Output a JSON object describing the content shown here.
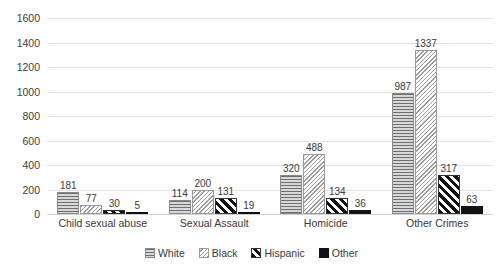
{
  "chart_data": {
    "type": "bar",
    "title": "",
    "subtitle": "",
    "xlabel": "",
    "ylabel": "",
    "ylim": [
      0,
      1600
    ],
    "yticks": [
      0,
      200,
      400,
      600,
      800,
      1000,
      1200,
      1400,
      1600
    ],
    "grid": true,
    "legend_position": "bottom",
    "categories": [
      "Child sexual abuse",
      "Sexual Assault",
      "Homicide",
      "Other Crimes"
    ],
    "series": [
      {
        "name": "White",
        "pattern": "horizontal-lines",
        "color": "#c9c9c9",
        "values": [
          181,
          114,
          320,
          987
        ]
      },
      {
        "name": "Black",
        "pattern": "light-diagonal",
        "color": "#ffffff",
        "values": [
          77,
          200,
          488,
          1337
        ]
      },
      {
        "name": "Hispanic",
        "pattern": "thick-diagonal",
        "color": "#111111",
        "values": [
          30,
          131,
          134,
          317
        ]
      },
      {
        "name": "Other",
        "pattern": "solid-black",
        "color": "#111111",
        "values": [
          5,
          19,
          36,
          63
        ]
      }
    ],
    "data_labels": [
      [
        "181",
        "77",
        "30",
        "5"
      ],
      [
        "114",
        "200",
        "131",
        "19"
      ],
      [
        "320",
        "488",
        "134",
        "36"
      ],
      [
        "987",
        "1337",
        "317",
        "63"
      ]
    ]
  },
  "legend": {
    "items": [
      {
        "label": "White"
      },
      {
        "label": "Black"
      },
      {
        "label": "Hispanic"
      },
      {
        "label": "Other"
      }
    ]
  },
  "yaxis": {
    "labels": [
      "1600",
      "1400",
      "1200",
      "1000",
      "800",
      "600",
      "400",
      "200",
      "0"
    ]
  }
}
